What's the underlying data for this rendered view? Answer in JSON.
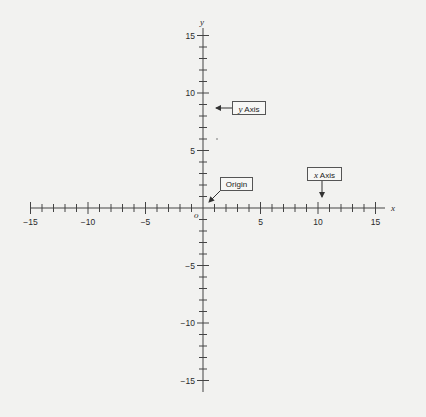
{
  "diagram": {
    "type": "cartesian-coordinate-plane",
    "x_axis": {
      "name": "x",
      "range": [
        -15,
        15
      ],
      "major_ticks": [
        -15,
        -10,
        -5,
        5,
        10,
        15
      ],
      "minor_tick_step": 1,
      "labels": [
        "−15",
        "−10",
        "−5",
        "5",
        "10",
        "15"
      ]
    },
    "y_axis": {
      "name": "y",
      "range": [
        -15,
        15
      ],
      "major_ticks": [
        15,
        10,
        5,
        -5,
        -10,
        -15
      ],
      "minor_tick_step": 1,
      "labels": [
        "15",
        "10",
        "5",
        "−5",
        "−10",
        "−15"
      ]
    },
    "origin_label": "o",
    "callouts": {
      "y_axis": {
        "italic": "y",
        "text": " Axis"
      },
      "origin": {
        "text": "Origin"
      },
      "x_axis": {
        "italic": "x",
        "text": " Axis"
      }
    },
    "colors": {
      "background": "#f2f2f0",
      "axis": "#444444",
      "text": "#2a2a2a"
    }
  }
}
